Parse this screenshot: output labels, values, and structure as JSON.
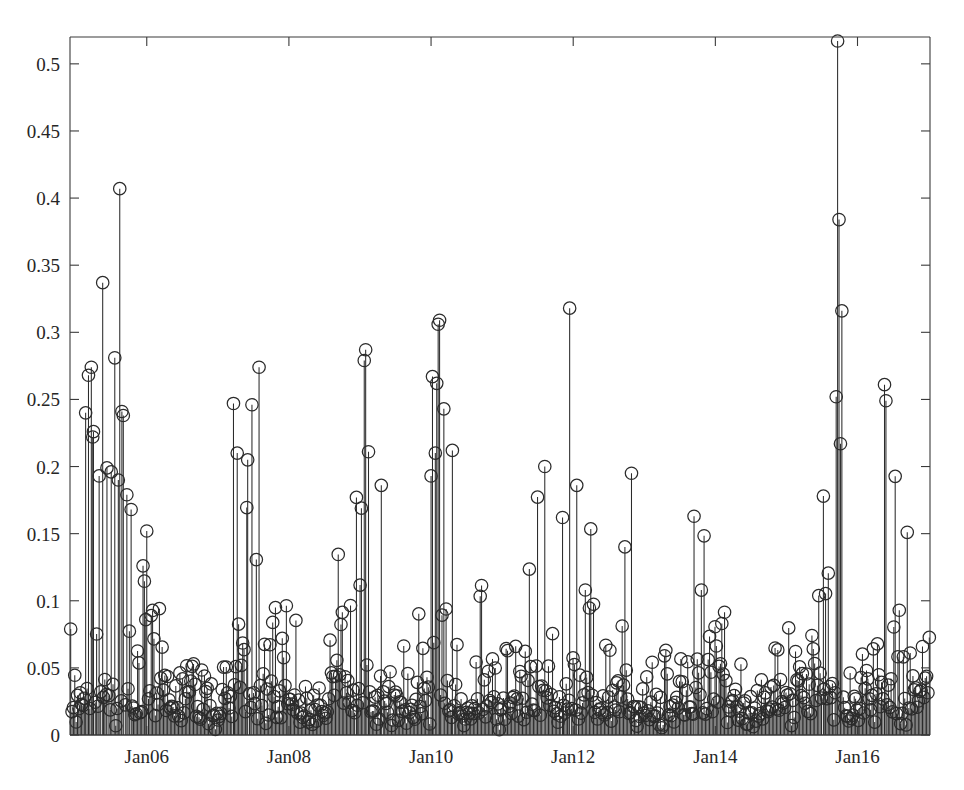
{
  "figure": {
    "title": "",
    "background_color": "#ffffff",
    "line_color": "#2b2b2b",
    "axis_color": "#3a3a3a",
    "marker": "circle-open",
    "marker_radius_px": 6.2
  },
  "chart_data": {
    "type": "line",
    "plot_style": "stem",
    "title": "",
    "xlabel": "",
    "ylabel": "",
    "grid": false,
    "legend": null,
    "marker": "o",
    "marker_filled": false,
    "ylim": [
      0,
      0.52
    ],
    "yticks": [
      0,
      0.05,
      0.1,
      0.15,
      0.2,
      0.25,
      0.3,
      0.35,
      0.4,
      0.45,
      0.5
    ],
    "ytick_labels": [
      "0",
      "0.05",
      "0.1",
      "0.15",
      "0.2",
      "0.25",
      "0.3",
      "0.35",
      "0.4",
      "0.45",
      "0.5"
    ],
    "xtick_labels": [
      "Jan06",
      "Jan08",
      "Jan10",
      "Jan12",
      "Jan14",
      "Jan16"
    ],
    "xtick_values": [
      2006.0,
      2008.0,
      2010.0,
      2012.0,
      2014.0,
      2016.0
    ],
    "xlim": [
      2004.92,
      2017.02
    ],
    "x_units": "date",
    "n_points": 630,
    "y_max_observed": 0.517,
    "y_min_observed": 0.0,
    "notable_peaks": [
      {
        "x": 2015.72,
        "y": 0.517
      },
      {
        "x": 2005.62,
        "y": 0.407
      },
      {
        "x": 2015.74,
        "y": 0.384
      },
      {
        "x": 2005.38,
        "y": 0.337
      },
      {
        "x": 2011.95,
        "y": 0.318
      },
      {
        "x": 2015.78,
        "y": 0.316
      },
      {
        "x": 2010.12,
        "y": 0.309
      },
      {
        "x": 2010.1,
        "y": 0.306
      },
      {
        "x": 2009.08,
        "y": 0.287
      },
      {
        "x": 2009.06,
        "y": 0.279
      },
      {
        "x": 2005.55,
        "y": 0.281
      },
      {
        "x": 2007.58,
        "y": 0.274
      },
      {
        "x": 2005.22,
        "y": 0.274
      },
      {
        "x": 2005.18,
        "y": 0.268
      },
      {
        "x": 2010.02,
        "y": 0.267
      },
      {
        "x": 2016.38,
        "y": 0.261
      },
      {
        "x": 2010.08,
        "y": 0.262
      },
      {
        "x": 2015.7,
        "y": 0.252
      },
      {
        "x": 2016.4,
        "y": 0.249
      },
      {
        "x": 2007.22,
        "y": 0.247
      },
      {
        "x": 2007.48,
        "y": 0.246
      },
      {
        "x": 2010.18,
        "y": 0.243
      },
      {
        "x": 2005.65,
        "y": 0.241
      },
      {
        "x": 2005.67,
        "y": 0.238
      },
      {
        "x": 2005.14,
        "y": 0.24
      },
      {
        "x": 2005.25,
        "y": 0.226
      },
      {
        "x": 2005.24,
        "y": 0.222
      },
      {
        "x": 2015.76,
        "y": 0.217
      },
      {
        "x": 2010.3,
        "y": 0.212
      },
      {
        "x": 2009.12,
        "y": 0.211
      },
      {
        "x": 2010.06,
        "y": 0.21
      },
      {
        "x": 2007.42,
        "y": 0.205
      },
      {
        "x": 2011.6,
        "y": 0.2
      },
      {
        "x": 2005.33,
        "y": 0.193
      },
      {
        "x": 2005.44,
        "y": 0.199
      },
      {
        "x": 2005.5,
        "y": 0.196
      },
      {
        "x": 2012.82,
        "y": 0.195
      },
      {
        "x": 2010.0,
        "y": 0.193
      },
      {
        "x": 2005.6,
        "y": 0.19
      },
      {
        "x": 2009.3,
        "y": 0.186
      },
      {
        "x": 2012.05,
        "y": 0.186
      },
      {
        "x": 2005.72,
        "y": 0.179
      },
      {
        "x": 2008.95,
        "y": 0.177
      },
      {
        "x": 2009.02,
        "y": 0.169
      },
      {
        "x": 2015.52,
        "y": 0.178
      },
      {
        "x": 2013.7,
        "y": 0.163
      },
      {
        "x": 2011.85,
        "y": 0.162
      },
      {
        "x": 2005.78,
        "y": 0.168
      },
      {
        "x": 2006.0,
        "y": 0.152
      },
      {
        "x": 2016.7,
        "y": 0.151
      }
    ],
    "series": [
      {
        "name": "series-1",
        "baseline": 0,
        "values_note": "dense daily/weekly positive-valued series; full point list below as [x, y] pairs"
      }
    ]
  }
}
